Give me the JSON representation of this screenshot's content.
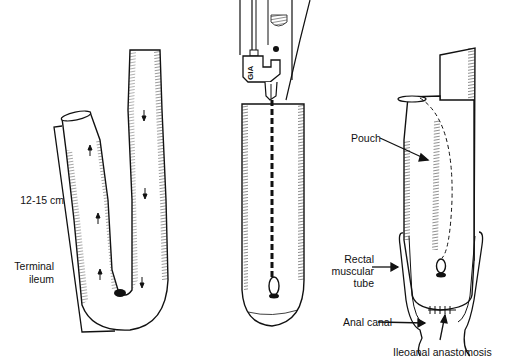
{
  "figure": {
    "panels": [
      {
        "id": "panel-1",
        "description": "Terminal ileum folded into J-shape",
        "labels": {
          "length": "12-15 cm",
          "terminal_ileum_line1": "Terminal",
          "terminal_ileum_line2": "ileum"
        }
      },
      {
        "id": "panel-2",
        "description": "Stapler creating side-to-side pouch",
        "labels": {
          "stapler": "GIA"
        }
      },
      {
        "id": "panel-3",
        "description": "Completed J-pouch with ileoanal anastomosis",
        "labels": {
          "pouch": "Pouch",
          "rectal_line1": "Rectal",
          "rectal_line2": "muscular",
          "rectal_line3": "tube",
          "anal_canal": "Anal canal",
          "anastomosis": "Ileoanal anastomosis"
        }
      }
    ],
    "colors": {
      "ink": "#111111",
      "background": "#ffffff",
      "shade": "#555555"
    }
  }
}
